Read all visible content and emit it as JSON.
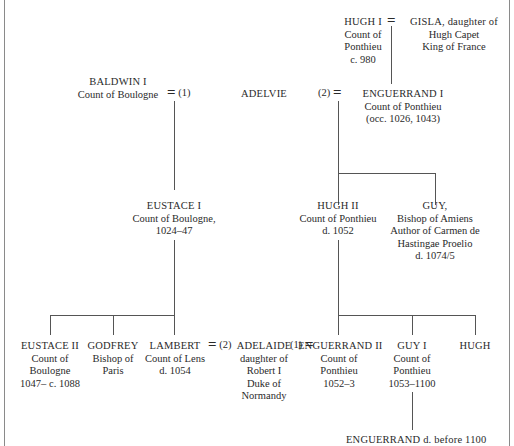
{
  "diagram": {
    "type": "genealogy",
    "nodes": {
      "hugh_i": {
        "name": "HUGH I",
        "lines": [
          "Count of",
          "Ponthieu",
          "c. 980"
        ]
      },
      "gisla": {
        "name": "GISLA, daughter of",
        "lines": [
          "Hugh Capet",
          "King of France"
        ]
      },
      "baldwin_i": {
        "name": "BALDWIN I",
        "lines": [
          "Count of Boulogne"
        ]
      },
      "adelvie": {
        "name": "ADELVIE",
        "lines": []
      },
      "enguerrand_i": {
        "name": "ENGUERRAND I",
        "lines": [
          "Count of Ponthieu",
          "(occ. 1026, 1043)"
        ]
      },
      "eustace_i": {
        "name": "EUSTACE I",
        "lines": [
          "Count of Boulogne,",
          "1024–47"
        ]
      },
      "hugh_ii": {
        "name": "HUGH II",
        "lines": [
          "Count of Ponthieu",
          "d. 1052"
        ]
      },
      "guy_bishop": {
        "name": "GUY,",
        "lines": [
          "Bishop of Amiens",
          "Author of Carmen de",
          "Hastingae Proelio",
          "d. 1074/5"
        ]
      },
      "eustace_ii": {
        "name": "EUSTACE II",
        "lines": [
          "Count of",
          "Boulogne",
          "1047– c. 1088"
        ]
      },
      "godfrey": {
        "name": "GODFREY",
        "lines": [
          "Bishop of",
          "Paris"
        ]
      },
      "lambert": {
        "name": "LAMBERT",
        "lines": [
          "Count of Lens",
          "d. 1054"
        ]
      },
      "adelaide": {
        "name": "ADELAIDE",
        "lines": [
          "daughter of",
          "Robert I",
          "Duke of",
          "Normandy"
        ]
      },
      "enguerrand_ii": {
        "name": "ENGUERRAND II",
        "lines": [
          "Count of",
          "Ponthieu",
          "1052–3"
        ]
      },
      "guy_i": {
        "name": "GUY I",
        "lines": [
          "Count of",
          "Ponthieu",
          "1053–1100"
        ]
      },
      "hugh": {
        "name": "HUGH",
        "lines": []
      },
      "enguerrand_iii": {
        "name": "ENGUERRAND d. before 1100",
        "lines": []
      }
    },
    "marriages": {
      "hugh_gisla": {
        "symbol": "="
      },
      "baldwin_adelvie": {
        "symbol": "=",
        "order": "(1)"
      },
      "adelvie_enguerrand": {
        "symbol": "=",
        "order": "(2)"
      },
      "lambert_adelaide": {
        "symbol": "=",
        "order": "(2)"
      },
      "adelaide_enguerrand": {
        "symbol": "=",
        "order": "(1)"
      }
    }
  }
}
